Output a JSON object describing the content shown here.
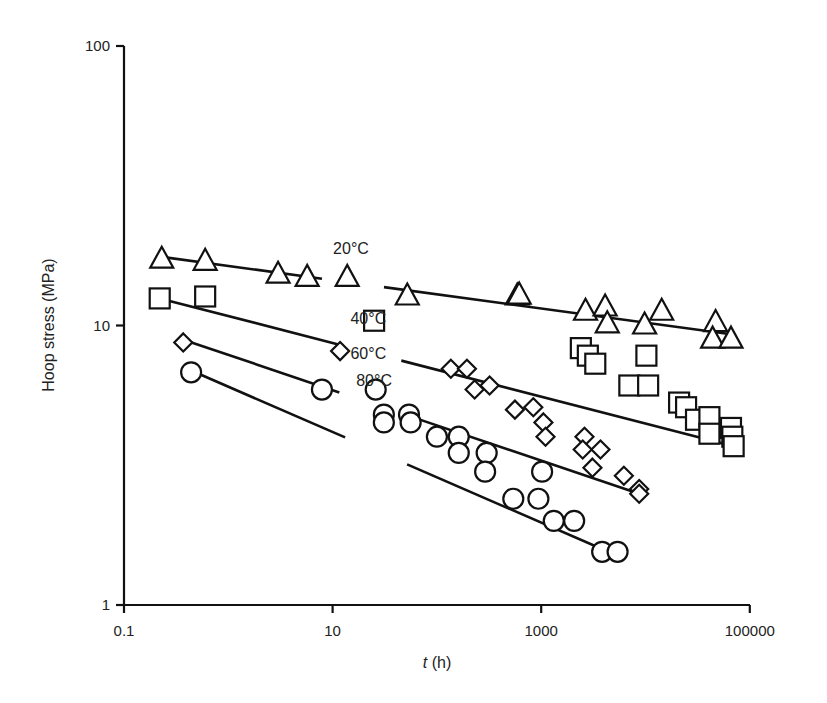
{
  "chart_data": {
    "type": "scatter",
    "title": "",
    "xlabel": "t (h)",
    "xlabel_italic_part": "t",
    "xlabel_unit": " (h)",
    "ylabel": "Hoop stress (MPa)",
    "xscale": "log",
    "yscale": "log",
    "xlim": [
      0.1,
      100000
    ],
    "ylim": [
      1,
      100
    ],
    "x_ticks": [
      0.1,
      10,
      1000,
      100000
    ],
    "x_tick_labels": [
      "0.1",
      "10",
      "1000",
      "100000"
    ],
    "y_ticks": [
      1,
      10,
      100
    ],
    "y_tick_labels": [
      "1",
      "10",
      "100"
    ],
    "grid": false,
    "legend": "inline labels",
    "series": [
      {
        "name": "20°C",
        "marker": "triangle",
        "label_pos": {
          "x": 15,
          "y": 19
        },
        "points": [
          [
            0.23,
            17.2
          ],
          [
            0.6,
            16.9
          ],
          [
            3.0,
            15.2
          ],
          [
            5.7,
            14.8
          ],
          [
            13.8,
            14.8
          ],
          [
            52,
            12.7
          ],
          [
            590,
            12.7
          ],
          [
            615,
            12.8
          ],
          [
            2660,
            11.2
          ],
          [
            4100,
            11.6
          ],
          [
            4300,
            10.1
          ],
          [
            9800,
            10.0
          ],
          [
            14300,
            11.2
          ],
          [
            47000,
            10.2
          ],
          [
            44000,
            8.9
          ],
          [
            66000,
            8.9
          ]
        ],
        "fit": [
          [
            0.23,
            17.6
          ],
          [
            66000,
            9.3
          ]
        ]
      },
      {
        "name": "40°C",
        "marker": "square",
        "label_pos": {
          "x": 22,
          "y": 10.6
        },
        "points": [
          [
            0.22,
            12.5
          ],
          [
            0.6,
            12.7
          ],
          [
            25,
            10.4
          ],
          [
            2400,
            8.3
          ],
          [
            2800,
            7.8
          ],
          [
            3300,
            7.3
          ],
          [
            10200,
            7.8
          ],
          [
            7000,
            6.1
          ],
          [
            10600,
            6.1
          ],
          [
            21000,
            5.3
          ],
          [
            24500,
            5.1
          ],
          [
            30500,
            4.6
          ],
          [
            41000,
            4.7
          ],
          [
            41000,
            4.1
          ],
          [
            66000,
            4.3
          ],
          [
            68000,
            4.0
          ],
          [
            70000,
            3.7
          ]
        ],
        "fit": [
          [
            0.22,
            12.5
          ],
          [
            70000,
            3.7
          ]
        ]
      },
      {
        "name": "60°C",
        "marker": "diamond",
        "label_pos": {
          "x": 22,
          "y": 8.0
        },
        "points": [
          [
            0.37,
            8.7
          ],
          [
            11.8,
            8.1
          ],
          [
            136,
            7.0
          ],
          [
            194,
            7.0
          ],
          [
            230,
            5.9
          ],
          [
            320,
            6.1
          ],
          [
            560,
            5.0
          ],
          [
            840,
            5.1
          ],
          [
            1050,
            4.5
          ],
          [
            1100,
            4.0
          ],
          [
            2600,
            4.0
          ],
          [
            2500,
            3.6
          ],
          [
            3700,
            3.6
          ],
          [
            3100,
            3.1
          ],
          [
            6200,
            2.9
          ],
          [
            8700,
            2.6
          ],
          [
            8700,
            2.5
          ]
        ],
        "fit": [
          [
            0.37,
            8.9
          ],
          [
            8700,
            2.5
          ]
        ]
      },
      {
        "name": "80°C",
        "marker": "circle",
        "label_pos": {
          "x": 25,
          "y": 6.4
        },
        "points": [
          [
            0.44,
            6.8
          ],
          [
            7.9,
            5.9
          ],
          [
            25.9,
            5.9
          ],
          [
            31,
            4.8
          ],
          [
            31,
            4.5
          ],
          [
            54,
            4.8
          ],
          [
            56,
            4.5
          ],
          [
            100,
            4.0
          ],
          [
            162,
            4.0
          ],
          [
            162,
            3.5
          ],
          [
            300,
            3.5
          ],
          [
            290,
            3.0
          ],
          [
            540,
            2.4
          ],
          [
            940,
            2.4
          ],
          [
            1020,
            3.0
          ],
          [
            1320,
            2.0
          ],
          [
            2070,
            2.0
          ],
          [
            3840,
            1.55
          ],
          [
            5400,
            1.55
          ]
        ],
        "fit": [
          [
            0.44,
            6.9
          ],
          [
            5400,
            1.5
          ]
        ]
      }
    ]
  }
}
